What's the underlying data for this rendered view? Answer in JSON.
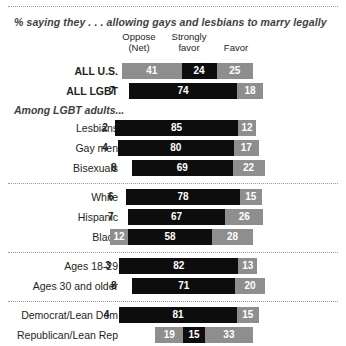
{
  "title": "% saying they . . . allowing gays and lesbians to marry legally",
  "headers": {
    "oppose_line1": "Oppose",
    "oppose_line2": "(Net)",
    "strongly_line1": "Strongly",
    "strongly_line2": "favor",
    "favor": "Favor"
  },
  "section_note": "Among LGBT adults...",
  "colors": {
    "oppose": "#8e8e8e",
    "strongly_favor": "#0d0d0d",
    "favor": "#8e8e8e",
    "text": "#231f20",
    "muted": "#3f3f3f"
  },
  "chart_data": {
    "type": "bar",
    "subtype": "stacked-horizontal",
    "title": "% saying they . . . allowing gays and lesbians to marry legally",
    "xlabel": "",
    "ylabel": "",
    "grid": false,
    "legend_position": "top",
    "series": [
      {
        "name": "Oppose (Net)",
        "color": "#8e8e8e"
      },
      {
        "name": "Strongly favor",
        "color": "#0d0d0d"
      },
      {
        "name": "Favor",
        "color": "#8e8e8e"
      }
    ],
    "categories": [
      "ALL U.S.",
      "ALL LGBT",
      "Lesbians",
      "Gay men",
      "Bisexuals",
      "White",
      "Hispanic",
      "Black",
      "Ages 18-29",
      "Ages 30 and older",
      "Democrat/Lean Dem",
      "Republican/Lean Rep"
    ],
    "rows": [
      {
        "label": "ALL U.S.",
        "bold": true,
        "group": "total",
        "oppose": 41,
        "strongly_favor": 24,
        "favor": 25,
        "oppose_outside": false
      },
      {
        "label": "ALL LGBT",
        "bold": true,
        "group": "total",
        "oppose": 7,
        "strongly_favor": 74,
        "favor": 18,
        "oppose_outside": true
      },
      {
        "label": "Lesbians",
        "bold": false,
        "group": "sexual-identity",
        "oppose": 2,
        "strongly_favor": 85,
        "favor": 12,
        "oppose_outside": true
      },
      {
        "label": "Gay men",
        "bold": false,
        "group": "sexual-identity",
        "oppose": 4,
        "strongly_favor": 80,
        "favor": 17,
        "oppose_outside": true
      },
      {
        "label": "Bisexuals",
        "bold": false,
        "group": "sexual-identity",
        "oppose": 8,
        "strongly_favor": 69,
        "favor": 22,
        "oppose_outside": true
      },
      {
        "label": "White",
        "bold": false,
        "group": "race",
        "oppose": 6,
        "strongly_favor": 78,
        "favor": 15,
        "oppose_outside": true
      },
      {
        "label": "Hispanic",
        "bold": false,
        "group": "race",
        "oppose": 7,
        "strongly_favor": 67,
        "favor": 26,
        "oppose_outside": true
      },
      {
        "label": "Black",
        "bold": false,
        "group": "race",
        "oppose": 12,
        "strongly_favor": 58,
        "favor": 28,
        "oppose_outside": false
      },
      {
        "label": "Ages 18-29",
        "bold": false,
        "group": "age",
        "oppose": 3,
        "strongly_favor": 82,
        "favor": 13,
        "oppose_outside": true
      },
      {
        "label": "Ages 30 and older",
        "bold": false,
        "group": "age",
        "oppose": 8,
        "strongly_favor": 71,
        "favor": 20,
        "oppose_outside": true
      },
      {
        "label": "Democrat/Lean Dem",
        "bold": false,
        "group": "party",
        "oppose": 4,
        "strongly_favor": 81,
        "favor": 15,
        "oppose_outside": true
      },
      {
        "label": "Republican/Lean Rep",
        "bold": false,
        "group": "party",
        "oppose": 19,
        "strongly_favor": 15,
        "favor": 33,
        "oppose_outside": false
      }
    ]
  },
  "layout": {
    "label_width": 118,
    "bar_origin_x": 122,
    "unit_px": 1.455,
    "row_height": 20
  }
}
